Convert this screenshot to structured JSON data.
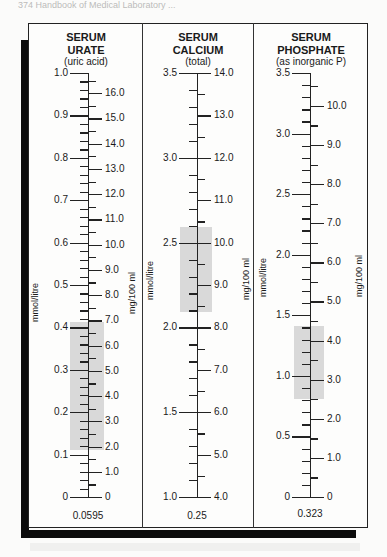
{
  "page_header": "374   Handbook of Medical Laboratory ...",
  "chart_data": [
    {
      "type": "table",
      "title": "SERUM URATE",
      "subtitle": "(uric acid)",
      "left_unit": "mmol/litre",
      "right_unit": "mg/100 ml",
      "left_range": [
        0,
        1.0
      ],
      "right_range": [
        0,
        16.8
      ],
      "left_labels": [
        "1.0",
        "0.9",
        "0.8",
        "0.7",
        "0.6",
        "0.5",
        "0.4",
        "0.3",
        "0.2",
        "0.1",
        "0"
      ],
      "right_labels": [
        "16.0",
        "15.0",
        "14.0",
        "13.0",
        "12.0",
        "11.0",
        "10.0",
        "9.0",
        "8.0",
        "7.0",
        "6.0",
        "5.0",
        "4.0",
        "3.0",
        "2.0",
        "1.0",
        "0"
      ],
      "reference_band_mmol": [
        0.12,
        0.41
      ],
      "reference_band_mg": [
        2.0,
        7.0
      ],
      "conversion_factor": "0.0595"
    },
    {
      "type": "table",
      "title": "SERUM CALCIUM",
      "subtitle": "(total)",
      "left_unit": "mmol/litre",
      "right_unit": "mg/100 ml",
      "left_range": [
        1.0,
        3.5
      ],
      "right_range": [
        4.0,
        14.0
      ],
      "left_labels": [
        "3.5",
        "3.0",
        "2.5",
        "2.0",
        "1.5",
        "1.0"
      ],
      "right_labels": [
        "14.0",
        "13.0",
        "12.0",
        "11.0",
        "10.0",
        "9.0",
        "8.0",
        "7.0",
        "6.0",
        "5.0",
        "4.0"
      ],
      "reference_band_mmol": [
        2.12,
        2.62
      ],
      "reference_band_mg": [
        8.5,
        10.5
      ],
      "conversion_factor": "0.25"
    },
    {
      "type": "table",
      "title": "SERUM PHOSPHATE",
      "subtitle": "(as inorganic P)",
      "left_unit": "mmol/litre",
      "right_unit": "mg/100 ml",
      "left_range": [
        0,
        3.5
      ],
      "right_range": [
        0,
        10.84
      ],
      "left_labels": [
        "3.5",
        "3.0",
        "2.5",
        "2.0",
        "1.5",
        "1.0",
        "0.5",
        "0"
      ],
      "right_labels": [
        "10.0",
        "9.0",
        "8.0",
        "7.0",
        "6.0",
        "5.0",
        "4.0",
        "3.0",
        "2.0",
        "1.0",
        "0"
      ],
      "reference_band_mmol": [
        0.8,
        1.4
      ],
      "reference_band_mg": [
        2.5,
        4.5
      ],
      "conversion_factor": "0.323"
    }
  ],
  "columns": [
    {
      "title1": "SERUM",
      "title2": "URATE",
      "subtitle": "(uric acid)",
      "left_unit": "mmol/litre",
      "right_unit": "mg/100 ml",
      "factor": "0.0595"
    },
    {
      "title1": "SERUM",
      "title2": "CALCIUM",
      "subtitle": "(total)",
      "left_unit": "mmol/litre",
      "right_unit": "mg/100 ml",
      "factor": "0.25"
    },
    {
      "title1": "SERUM",
      "title2": "PHOSPHATE",
      "subtitle": "(as inorganic P)",
      "left_unit": "mmol/litre",
      "right_unit": "mg/100 ml",
      "factor": "0.323"
    }
  ]
}
